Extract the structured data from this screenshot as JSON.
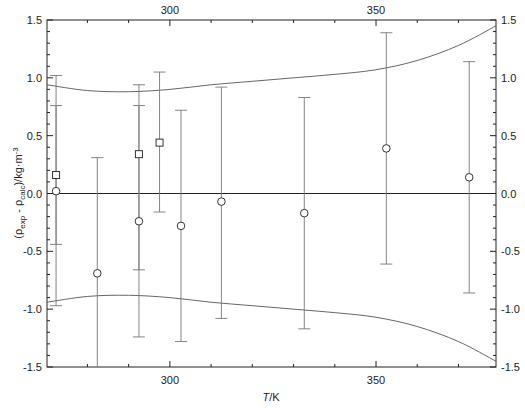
{
  "chart_data": {
    "type": "scatter",
    "title": "",
    "xlabel": "T/K",
    "ylabel": "(ρ_exp - ρ_calc)/kg·m-3",
    "xlim": [
      270.2,
      379.1
    ],
    "ylim": [
      -1.5,
      1.5
    ],
    "x_ticks": [
      300,
      350
    ],
    "x_minor_ticks": [
      280,
      290,
      310,
      320,
      330,
      340,
      360,
      370
    ],
    "y_ticks": [
      -1.5,
      -1.0,
      -0.5,
      0.0,
      0.5,
      1.0,
      1.5
    ],
    "y_tick_labels": [
      "-1.5",
      "-1.0",
      "-0.5",
      "0.0",
      "0.5",
      "1.0",
      "1.5"
    ],
    "grid": false,
    "legend": null,
    "mirror_axes": {
      "top": true,
      "right": true
    },
    "zero_line": true,
    "series": [
      {
        "name": "circles",
        "marker": "circle",
        "points": [
          {
            "x": 272.4,
            "y": 0.02,
            "err_high": 0.76,
            "err_low": -0.97
          },
          {
            "x": 282.4,
            "y": -0.69,
            "err_high": 0.31,
            "err_low": -1.5
          },
          {
            "x": 292.5,
            "y": -0.24,
            "err_high": 0.94,
            "err_low": -1.24
          },
          {
            "x": 302.7,
            "y": -0.28,
            "err_high": 0.72,
            "err_low": -1.28
          },
          {
            "x": 312.5,
            "y": -0.07,
            "err_high": 0.92,
            "err_low": -1.08
          },
          {
            "x": 332.6,
            "y": -0.17,
            "err_high": 0.83,
            "err_low": -1.17
          },
          {
            "x": 352.5,
            "y": 0.39,
            "err_high": 1.39,
            "err_low": -0.61
          },
          {
            "x": 372.6,
            "y": 0.14,
            "err_high": 1.14,
            "err_low": -0.86
          }
        ]
      },
      {
        "name": "squares",
        "marker": "square",
        "points": [
          {
            "x": 272.4,
            "y": 0.16,
            "err_high": 1.02,
            "err_low": -0.44
          },
          {
            "x": 292.5,
            "y": 0.34,
            "err_high": 0.76,
            "err_low": -0.66
          },
          {
            "x": 297.5,
            "y": 0.44,
            "err_high": 1.05,
            "err_low": -0.16
          }
        ]
      },
      {
        "name": "upper-uncertainty-band",
        "type": "line",
        "points": [
          [
            270.2,
            0.94
          ],
          [
            280,
            0.89
          ],
          [
            290,
            0.88
          ],
          [
            300,
            0.9
          ],
          [
            310,
            0.94
          ],
          [
            320,
            0.97
          ],
          [
            330,
            1.0
          ],
          [
            340,
            1.03
          ],
          [
            350,
            1.07
          ],
          [
            360,
            1.15
          ],
          [
            370,
            1.28
          ],
          [
            379.1,
            1.45
          ]
        ]
      },
      {
        "name": "lower-uncertainty-band",
        "type": "line",
        "points": [
          [
            270.2,
            -0.94
          ],
          [
            280,
            -0.89
          ],
          [
            290,
            -0.88
          ],
          [
            300,
            -0.9
          ],
          [
            310,
            -0.94
          ],
          [
            320,
            -0.97
          ],
          [
            330,
            -1.0
          ],
          [
            340,
            -1.03
          ],
          [
            350,
            -1.07
          ],
          [
            360,
            -1.15
          ],
          [
            370,
            -1.28
          ],
          [
            379.1,
            -1.45
          ]
        ]
      }
    ]
  },
  "labels": {
    "xlabel_T": "T",
    "xlabel_unit": "/K",
    "ylabel_open": "(ρ",
    "ylabel_sub1": "exp",
    "ylabel_mid": " - ρ",
    "ylabel_sub2": "calc",
    "ylabel_close": ")/kg·m",
    "ylabel_sup": "-3"
  }
}
